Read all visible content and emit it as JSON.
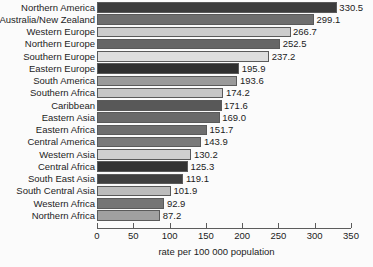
{
  "chart_data": {
    "type": "bar",
    "orientation": "horizontal",
    "title": "",
    "xlabel": "rate per 100 000 population",
    "ylabel": "",
    "xlim": [
      0,
      350
    ],
    "xticks": [
      0,
      50,
      100,
      150,
      200,
      250,
      300,
      350
    ],
    "grid": false,
    "legend": false,
    "categories": [
      "Northern America",
      "Australia/New Zealand",
      "Western Europe",
      "Northern Europe",
      "Southern Europe",
      "Eastern Europe",
      "South America",
      "Southern Africa",
      "Caribbean",
      "Eastern Asia",
      "Eastern Africa",
      "Central America",
      "Western Asia",
      "Central Africa",
      "South East Asia",
      "South Central Asia",
      "Western Africa",
      "Northern Africa"
    ],
    "values": [
      330.5,
      299.1,
      266.7,
      252.5,
      237.2,
      195.9,
      193.6,
      174.2,
      171.6,
      169.0,
      151.7,
      143.9,
      130.2,
      125.3,
      119.1,
      101.9,
      92.9,
      87.2
    ],
    "value_labels": [
      "330.5",
      "299.1",
      "266.7",
      "252.5",
      "237.2",
      "195.9",
      "193.6",
      "174.2",
      "171.6",
      "169.0",
      "151.7",
      "143.9",
      "130.2",
      "125.3",
      "119.1",
      "101.9",
      "92.9",
      "87.2"
    ],
    "bar_colors": [
      "#3c3c3c",
      "#6e6e6e",
      "#cccccc",
      "#666666",
      "#dedede",
      "#2f2f2f",
      "#9a9a9a",
      "#c6c6c6",
      "#585858",
      "#6a6a6a",
      "#6e6e6e",
      "#7a7a7a",
      "#cfcfcf",
      "#333333",
      "#3f3f3f",
      "#bcbcbc",
      "#757575",
      "#a0a0a0"
    ],
    "bar_border_color": "#5a5a5a",
    "axis_color": "#5c5c5c",
    "text_color": "#1b1b1b",
    "background": "#fbfbfb"
  }
}
